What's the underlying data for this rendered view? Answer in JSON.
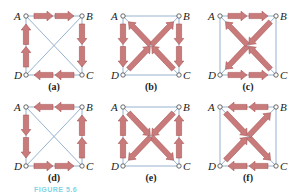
{
  "figure": {
    "colors": {
      "edge_line": "#8aa9c9",
      "arrow_fill": "#c97a7a",
      "arrow_stroke": "#a85858",
      "vertex_stroke": "#444444",
      "caption": "#7fd4e6"
    },
    "vertex_labels": {
      "A": "A",
      "B": "B",
      "C": "C",
      "D": "D"
    },
    "panels": [
      {
        "id": "a",
        "label": "(a)",
        "origin": [
          26,
          16
        ],
        "arrows": [
          [
            "A",
            "B"
          ],
          [
            "B",
            "C"
          ],
          [
            "C",
            "D"
          ],
          [
            "D",
            "A"
          ]
        ],
        "lines": [
          [
            "A",
            "C"
          ],
          [
            "B",
            "D"
          ]
        ]
      },
      {
        "id": "b",
        "label": "(b)",
        "origin": [
          123,
          16
        ],
        "arrows": [
          [
            "A",
            "D"
          ],
          [
            "B",
            "C"
          ],
          [
            "C",
            "A"
          ],
          [
            "D",
            "B"
          ]
        ],
        "lines": [
          [
            "A",
            "B"
          ],
          [
            "D",
            "C"
          ]
        ]
      },
      {
        "id": "c",
        "label": "(c)",
        "origin": [
          220,
          16
        ],
        "arrows": [
          [
            "A",
            "B"
          ],
          [
            "D",
            "C"
          ],
          [
            "B",
            "D"
          ],
          [
            "C",
            "A"
          ]
        ],
        "lines": [
          [
            "A",
            "D"
          ],
          [
            "B",
            "C"
          ]
        ]
      },
      {
        "id": "d",
        "label": "(d)",
        "origin": [
          26,
          107
        ],
        "arrows": [
          [
            "B",
            "A"
          ],
          [
            "A",
            "D"
          ],
          [
            "D",
            "C"
          ],
          [
            "C",
            "B"
          ]
        ],
        "lines": [
          [
            "A",
            "C"
          ],
          [
            "B",
            "D"
          ]
        ]
      },
      {
        "id": "e",
        "label": "(e)",
        "origin": [
          123,
          107
        ],
        "arrows": [
          [
            "D",
            "A"
          ],
          [
            "C",
            "B"
          ],
          [
            "A",
            "C"
          ],
          [
            "B",
            "D"
          ]
        ],
        "lines": [
          [
            "A",
            "B"
          ],
          [
            "D",
            "C"
          ]
        ]
      },
      {
        "id": "f",
        "label": "(f)",
        "origin": [
          220,
          107
        ],
        "arrows": [
          [
            "B",
            "A"
          ],
          [
            "C",
            "D"
          ],
          [
            "A",
            "C"
          ],
          [
            "D",
            "B"
          ]
        ],
        "lines": [
          [
            "A",
            "D"
          ],
          [
            "B",
            "C"
          ]
        ]
      }
    ],
    "caption": "FIGURE 5.6"
  }
}
